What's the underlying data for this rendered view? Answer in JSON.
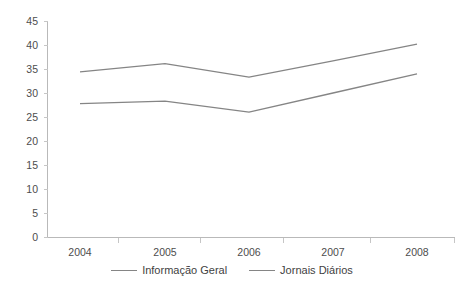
{
  "chart_data": {
    "type": "line",
    "title": "",
    "xlabel": "",
    "ylabel": "",
    "categories": [
      "2004",
      "2005",
      "2006",
      "2007",
      "2008"
    ],
    "series": [
      {
        "name": "Informação Geral",
        "values": [
          34.4,
          36.1,
          33.3,
          36.7,
          40.2
        ]
      },
      {
        "name": "Jornais Diários",
        "values": [
          27.8,
          28.3,
          26.0,
          30.0,
          34.0
        ]
      }
    ],
    "ylim": [
      0,
      45
    ],
    "yticks": [
      0,
      5,
      10,
      15,
      20,
      25,
      30,
      35,
      40,
      45
    ],
    "ytick_labels": [
      "0",
      "5",
      "10",
      "15",
      "20",
      "25",
      "30",
      "35",
      "40",
      "45"
    ],
    "grid": false,
    "legend_position": "bottom",
    "line_color": "#858585",
    "axis_color": "#b9b9b9",
    "text_color": "#4d4d4d"
  },
  "legend": {
    "items": [
      {
        "label": "Informação Geral"
      },
      {
        "label": "Jornais Diários"
      }
    ]
  },
  "axes": {
    "y_labels": [
      "45",
      "40",
      "35",
      "30",
      "25",
      "20",
      "15",
      "10",
      "5",
      "0"
    ],
    "x_labels": [
      "2004",
      "2005",
      "2006",
      "2007",
      "2008"
    ]
  },
  "header": {
    "cropped_title": ""
  }
}
